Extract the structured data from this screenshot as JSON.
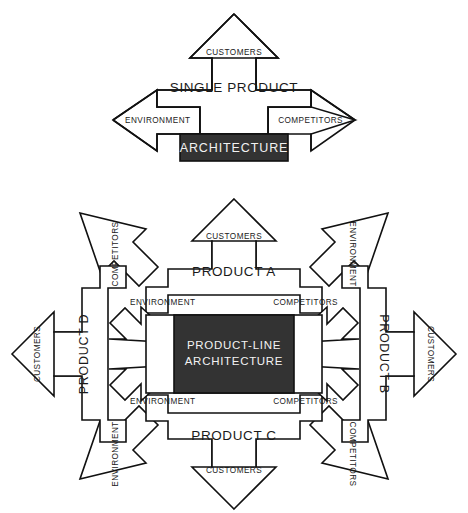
{
  "figure": {
    "title_visible": false,
    "background": "#ffffff",
    "line_color": "#111111",
    "dark_fill": "#333333",
    "light_text": "#f2f2f2"
  },
  "diagram_top": {
    "name": "single-product-diagram",
    "center_label": "SINGLE PRODUCT",
    "architecture_label": "ARCHITECTURE",
    "arrows": {
      "up": "CUSTOMERS",
      "left": "ENVIRONMENT",
      "right": "COMPETITORS"
    }
  },
  "diagram_bottom": {
    "name": "product-line-architecture-diagram",
    "center_label_line1": "PRODUCT-LINE",
    "center_label_line2": "ARCHITECTURE",
    "products": {
      "a": "PRODUCT A",
      "b": "PRODUCT B",
      "c": "PRODUCT C",
      "d": "PRODUCT D"
    },
    "outer_arrows": {
      "top": "CUSTOMERS",
      "bottom": "CUSTOMERS",
      "left": "CUSTOMERS",
      "right": "CUSTOMERS",
      "top_left": "COMPETITORS",
      "top_right": "ENVIRONMENT",
      "bottom_left": "ENVIRONMENT",
      "bottom_right": "COMPETITORS"
    },
    "inner_arrows": {
      "top_left": "ENVIRONMENT",
      "top_right": "COMPETITORS",
      "bottom_left": "ENVIRONMENT",
      "bottom_right": "COMPETITORS"
    }
  }
}
